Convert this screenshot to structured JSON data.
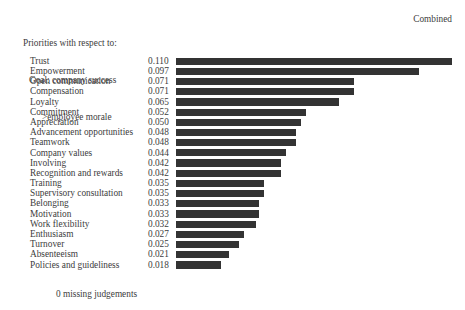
{
  "header": {
    "title_line1": "Priorities with respect to:",
    "title_line2": "Goal: company success",
    "title_line3": ">employee morale",
    "mode_label": "Combined"
  },
  "footer": {
    "missing_note": "0 missing judgements"
  },
  "style": {
    "bar_color": "#333333",
    "text_color": "#3c3c3c",
    "background": "#ffffff"
  },
  "chart_data": {
    "type": "bar",
    "orientation": "horizontal",
    "title": "Priorities with respect to: Goal: company success >employee morale",
    "subtitle": "Combined",
    "xlabel": "",
    "ylabel": "",
    "grid": false,
    "legend": "none",
    "value_labels_shown": true,
    "xlim": [
      0,
      0.11
    ],
    "annotations": [
      "0 missing judgements"
    ],
    "categories": [
      "Trust",
      "Empowerment",
      "Open communication",
      "Compensation",
      "Loyalty",
      "Commitment",
      "Appreciation",
      "Advancement opportunities",
      "Teamwork",
      "Company values",
      "Involving",
      "Recognition and rewards",
      "Training",
      "Supervisory consultation",
      "Belonging",
      "Motivation",
      "Work flexibility",
      "Enthusiasm",
      "Turnover",
      "Absenteeism",
      "Policies and guideliness"
    ],
    "values": [
      0.11,
      0.097,
      0.071,
      0.071,
      0.065,
      0.052,
      0.05,
      0.048,
      0.048,
      0.044,
      0.042,
      0.042,
      0.035,
      0.035,
      0.033,
      0.033,
      0.032,
      0.027,
      0.025,
      0.021,
      0.018
    ],
    "value_labels": [
      "0.110",
      "0.097",
      "0.071",
      "0.071",
      "0.065",
      "0.052",
      "0.050",
      "0.048",
      "0.048",
      "0.044",
      "0.042",
      "0.042",
      "0.035",
      "0.035",
      "0.033",
      "0.033",
      "0.032",
      "0.027",
      "0.025",
      "0.021",
      "0.018"
    ]
  }
}
